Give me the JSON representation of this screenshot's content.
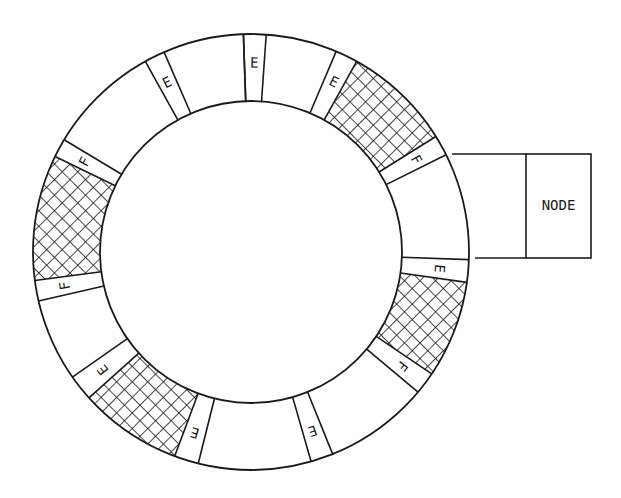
{
  "diagram": {
    "title": "",
    "ring": {
      "center": [
        251,
        252
      ],
      "outer_radius": 218,
      "inner_radius": 151,
      "stroke_color": "#1a1a1a",
      "hatch_color": "#1a1a1a"
    },
    "segments": [
      {
        "type": "label",
        "label": "E",
        "start_deg": -92,
        "end_deg": -86
      },
      {
        "type": "empty",
        "start_deg": -86,
        "end_deg": -67
      },
      {
        "type": "label",
        "label": "E",
        "start_deg": -67,
        "end_deg": -61
      },
      {
        "type": "hatched",
        "start_deg": -61,
        "end_deg": -32
      },
      {
        "type": "label",
        "label": "F",
        "start_deg": -32,
        "end_deg": -26.5
      },
      {
        "type": "empty",
        "start_deg": -26.5,
        "end_deg": 2
      },
      {
        "type": "label",
        "label": "E",
        "start_deg": 2,
        "end_deg": 8
      },
      {
        "type": "hatched",
        "start_deg": 8,
        "end_deg": 34
      },
      {
        "type": "label",
        "label": "F",
        "start_deg": 34,
        "end_deg": 40
      },
      {
        "type": "empty",
        "start_deg": 40,
        "end_deg": 68
      },
      {
        "type": "label",
        "label": "E",
        "start_deg": 68,
        "end_deg": 74
      },
      {
        "type": "empty",
        "start_deg": 74,
        "end_deg": 104
      },
      {
        "type": "label",
        "label": "E",
        "start_deg": 104,
        "end_deg": 110.5
      },
      {
        "type": "hatched",
        "start_deg": 110.5,
        "end_deg": 138
      },
      {
        "type": "label",
        "label": "E",
        "start_deg": 138,
        "end_deg": 145
      },
      {
        "type": "empty",
        "start_deg": 145,
        "end_deg": 167
      },
      {
        "type": "label",
        "label": "F",
        "start_deg": 167,
        "end_deg": 172.5
      },
      {
        "type": "hatched",
        "start_deg": 172.5,
        "end_deg": 206
      },
      {
        "type": "label",
        "label": "F",
        "start_deg": 206,
        "end_deg": 211
      },
      {
        "type": "empty",
        "start_deg": 211,
        "end_deg": 241
      },
      {
        "type": "label",
        "label": "E",
        "start_deg": 241,
        "end_deg": 246.5
      },
      {
        "type": "empty",
        "start_deg": 246.5,
        "end_deg": 268
      }
    ],
    "node": {
      "label": "NODE",
      "connector": {
        "top_y": 154,
        "bottom_y": 258,
        "top_x_start": 452,
        "bottom_x_start": 475
      },
      "box": {
        "x": 526,
        "y": 154,
        "width": 65,
        "height": 104
      }
    },
    "legend_meaning": {
      "E": "E",
      "F": "F"
    }
  }
}
